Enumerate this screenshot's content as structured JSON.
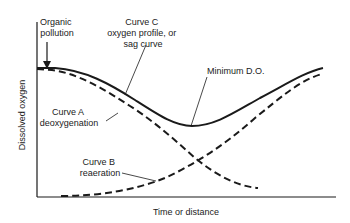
{
  "diagram": {
    "axes": {
      "y_label": "Dissolved oxygen",
      "x_label": "Time or distance"
    },
    "annotations": {
      "pollution": [
        "Organic",
        "pollution"
      ],
      "curve_c": [
        "Curve C",
        "oxygen profile, or",
        "sag curve"
      ],
      "minimum": "Minimum D.O.",
      "curve_a": [
        "Curve A",
        "deoxygenation"
      ],
      "curve_b": [
        "Curve B",
        "reaeration"
      ]
    },
    "colors": {
      "line": "#1a1a1a",
      "text": "#222222",
      "background": "#ffffff"
    }
  }
}
